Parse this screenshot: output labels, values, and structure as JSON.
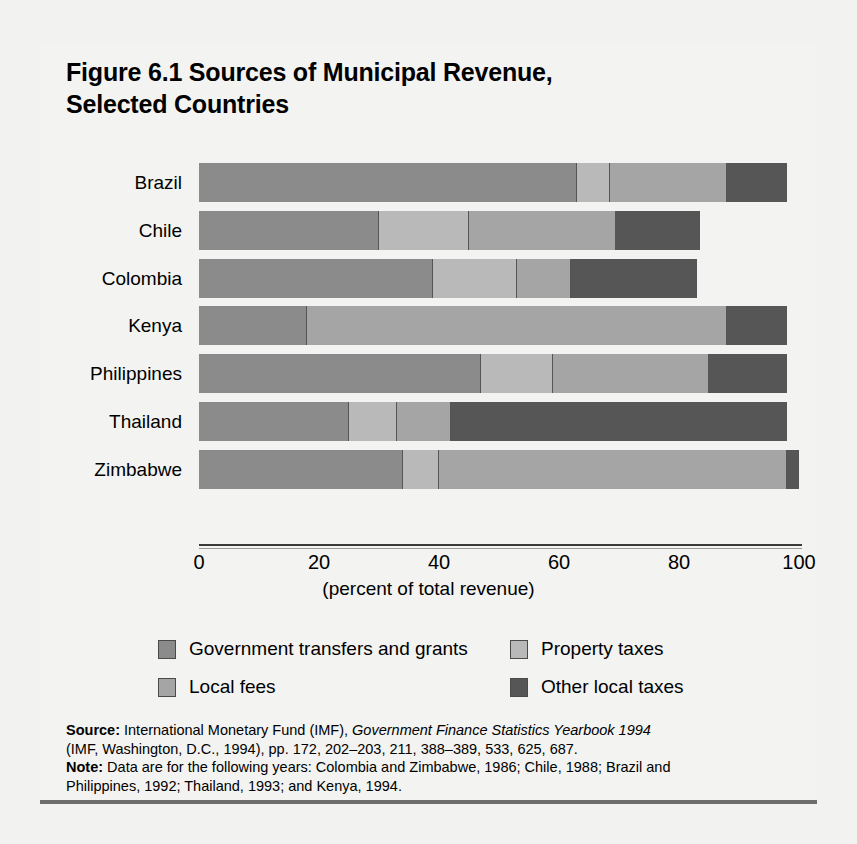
{
  "figure": {
    "title_line1": "Figure 6.1  Sources of Municipal Revenue,",
    "title_line2": "Selected Countries"
  },
  "axis": {
    "title": "(percent of total revenue)",
    "ticks": [
      "0",
      "20",
      "40",
      "60",
      "80",
      "100"
    ]
  },
  "legend": {
    "items": [
      {
        "label": "Government transfers and grants",
        "color": "#8b8b8b"
      },
      {
        "label": "Property taxes",
        "color": "#b9b9b9"
      },
      {
        "label": "Local fees",
        "color": "#a5a5a5"
      },
      {
        "label": "Other local taxes",
        "color": "#565656"
      }
    ]
  },
  "notes": {
    "source_label": "Source:",
    "source_text_1": " International Monetary Fund (IMF), ",
    "source_italic": "Government Finance Statistics Yearbook 1994",
    "source_text_2": "(IMF, Washington, D.C., 1994), pp. 172, 202–203, 211, 388–389, 533, 625, 687.",
    "note_label": "Note:",
    "note_text_1": " Data are for the following years: Colombia and Zimbabwe, 1986; Chile, 1988; Brazil and",
    "note_text_2": "Philippines, 1992; Thailand, 1993; and Kenya, 1994."
  },
  "chart_data": {
    "type": "bar",
    "orientation": "horizontal",
    "stacked": true,
    "title": "Figure 6.1  Sources of Municipal Revenue, Selected Countries",
    "xlabel": "(percent of total revenue)",
    "ylabel": "",
    "xlim": [
      0,
      100
    ],
    "xticks": [
      0,
      20,
      40,
      60,
      80,
      100
    ],
    "grid": false,
    "legend_position": "bottom",
    "categories": [
      "Brazil",
      "Chile",
      "Colombia",
      "Kenya",
      "Philippines",
      "Thailand",
      "Zimbabwe"
    ],
    "series": [
      {
        "name": "Government transfers and grants",
        "color": "#8b8b8b",
        "values": [
          63,
          30,
          39,
          18,
          47,
          25,
          34
        ]
      },
      {
        "name": "Property taxes",
        "color": "#b9b9b9",
        "values": [
          5.5,
          15,
          14,
          0,
          12,
          8,
          6
        ]
      },
      {
        "name": "Local fees",
        "color": "#a5a5a5",
        "values": [
          19.5,
          24.5,
          9,
          70,
          26,
          9,
          58
        ]
      },
      {
        "name": "Other local taxes",
        "color": "#565656",
        "values": [
          10,
          14,
          21,
          10,
          13,
          56,
          2
        ]
      }
    ],
    "totals": [
      98,
      83.5,
      83,
      98,
      98,
      98,
      100
    ]
  }
}
